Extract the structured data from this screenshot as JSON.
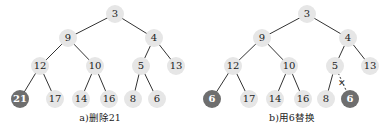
{
  "trees": [
    {
      "caption": "a)删除21",
      "caption_pos": [
        100,
        110
      ],
      "nodes": [
        {
          "id": "n3",
          "label": "3",
          "x": 115,
          "y": 14,
          "dark": false
        },
        {
          "id": "n9",
          "label": "9",
          "x": 68,
          "y": 38,
          "dark": false
        },
        {
          "id": "n4",
          "label": "4",
          "x": 154,
          "y": 38,
          "dark": false
        },
        {
          "id": "n12",
          "label": "12",
          "x": 40,
          "y": 66,
          "dark": false
        },
        {
          "id": "n10",
          "label": "10",
          "x": 95,
          "y": 66,
          "dark": false
        },
        {
          "id": "n5",
          "label": "5",
          "x": 141,
          "y": 66,
          "dark": false
        },
        {
          "id": "n13",
          "label": "13",
          "x": 176,
          "y": 66,
          "dark": false
        },
        {
          "id": "n21",
          "label": "21",
          "x": 20,
          "y": 99,
          "dark": true
        },
        {
          "id": "n17",
          "label": "17",
          "x": 55,
          "y": 99,
          "dark": false
        },
        {
          "id": "n14",
          "label": "14",
          "x": 81,
          "y": 99,
          "dark": false
        },
        {
          "id": "n16",
          "label": "16",
          "x": 109,
          "y": 99,
          "dark": false
        },
        {
          "id": "n8",
          "label": "8",
          "x": 133,
          "y": 99,
          "dark": false
        },
        {
          "id": "n6",
          "label": "6",
          "x": 157,
          "y": 99,
          "dark": false
        }
      ],
      "edges": [
        [
          "n3",
          "n9"
        ],
        [
          "n3",
          "n4"
        ],
        [
          "n9",
          "n12"
        ],
        [
          "n9",
          "n10"
        ],
        [
          "n4",
          "n5"
        ],
        [
          "n4",
          "n13"
        ],
        [
          "n12",
          "n21"
        ],
        [
          "n12",
          "n17"
        ],
        [
          "n10",
          "n14"
        ],
        [
          "n10",
          "n16"
        ],
        [
          "n5",
          "n8"
        ],
        [
          "n5",
          "n6"
        ]
      ],
      "broken_edges": []
    },
    {
      "caption": "b)用6替换",
      "caption_pos": [
        292,
        110
      ],
      "nodes": [
        {
          "id": "m3",
          "label": "3",
          "x": 307,
          "y": 14,
          "dark": false
        },
        {
          "id": "m9",
          "label": "9",
          "x": 262,
          "y": 38,
          "dark": false
        },
        {
          "id": "m4",
          "label": "4",
          "x": 348,
          "y": 38,
          "dark": false
        },
        {
          "id": "m12",
          "label": "12",
          "x": 233,
          "y": 66,
          "dark": false
        },
        {
          "id": "m10",
          "label": "10",
          "x": 289,
          "y": 66,
          "dark": false
        },
        {
          "id": "m5",
          "label": "5",
          "x": 335,
          "y": 66,
          "dark": false
        },
        {
          "id": "m13",
          "label": "13",
          "x": 370,
          "y": 66,
          "dark": false
        },
        {
          "id": "m6a",
          "label": "6",
          "x": 212,
          "y": 99,
          "dark": true
        },
        {
          "id": "m17",
          "label": "17",
          "x": 249,
          "y": 99,
          "dark": false
        },
        {
          "id": "m14",
          "label": "14",
          "x": 275,
          "y": 99,
          "dark": false
        },
        {
          "id": "m16",
          "label": "16",
          "x": 303,
          "y": 99,
          "dark": false
        },
        {
          "id": "m8",
          "label": "8",
          "x": 326,
          "y": 99,
          "dark": false
        },
        {
          "id": "m6b",
          "label": "6",
          "x": 350,
          "y": 99,
          "dark": true
        }
      ],
      "edges": [
        [
          "m3",
          "m9"
        ],
        [
          "m3",
          "m4"
        ],
        [
          "m9",
          "m12"
        ],
        [
          "m9",
          "m10"
        ],
        [
          "m4",
          "m5"
        ],
        [
          "m4",
          "m13"
        ],
        [
          "m12",
          "m6a"
        ],
        [
          "m12",
          "m17"
        ],
        [
          "m10",
          "m14"
        ],
        [
          "m10",
          "m16"
        ],
        [
          "m5",
          "m8"
        ]
      ],
      "broken_edges": [
        [
          "m5",
          "m6b"
        ]
      ],
      "cut_mark": {
        "label": "✕",
        "x": 342,
        "y": 83
      }
    }
  ]
}
